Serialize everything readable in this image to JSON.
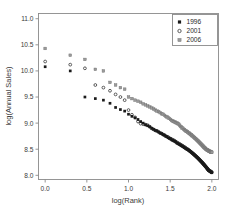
{
  "chart_data": {
    "type": "scatter",
    "title": "",
    "xlabel": "log(Rank)",
    "ylabel": "log(Annual Sales)",
    "xlim": [
      -0.08,
      2.08
    ],
    "ylim": [
      7.92,
      11.1
    ],
    "xticks": [
      "0.0",
      "0.5",
      "1.0",
      "1.5",
      "2.0"
    ],
    "xtick_values": [
      0.0,
      0.5,
      1.0,
      1.5,
      2.0
    ],
    "yticks": [
      "8.0",
      "8.5",
      "9.0",
      "9.5",
      "10.0",
      "10.5",
      "11.0"
    ],
    "ytick_values": [
      8.0,
      8.5,
      9.0,
      9.5,
      10.0,
      10.5,
      11.0
    ],
    "grid": false,
    "legend_position": "top-right",
    "series": [
      {
        "name": "1996",
        "marker": "filled-square",
        "color": "#1a1a1a",
        "points": [
          [
            0.0,
            10.08
          ],
          [
            0.301,
            10.0
          ],
          [
            0.477,
            9.5
          ],
          [
            0.602,
            9.47
          ],
          [
            0.699,
            9.44
          ],
          [
            0.778,
            9.38
          ],
          [
            0.845,
            9.3
          ],
          [
            0.903,
            9.26
          ],
          [
            0.954,
            9.23
          ],
          [
            1.0,
            9.17
          ],
          [
            1.041,
            9.13
          ],
          [
            1.079,
            9.1
          ],
          [
            1.114,
            9.07
          ],
          [
            1.146,
            9.03
          ],
          [
            1.176,
            9.0
          ],
          [
            1.204,
            8.97
          ],
          [
            1.23,
            8.95
          ],
          [
            1.255,
            8.93
          ],
          [
            1.279,
            8.9
          ],
          [
            1.301,
            8.88
          ],
          [
            1.322,
            8.86
          ],
          [
            1.342,
            8.85
          ],
          [
            1.362,
            8.83
          ],
          [
            1.38,
            8.81
          ],
          [
            1.398,
            8.8
          ],
          [
            1.415,
            8.78
          ],
          [
            1.431,
            8.77
          ],
          [
            1.447,
            8.75
          ],
          [
            1.462,
            8.74
          ],
          [
            1.477,
            8.72
          ],
          [
            1.491,
            8.71
          ],
          [
            1.505,
            8.7
          ],
          [
            1.519,
            8.68
          ],
          [
            1.531,
            8.67
          ],
          [
            1.544,
            8.66
          ],
          [
            1.556,
            8.65
          ],
          [
            1.568,
            8.64
          ],
          [
            1.58,
            8.62
          ],
          [
            1.591,
            8.61
          ],
          [
            1.602,
            8.6
          ],
          [
            1.613,
            8.59
          ],
          [
            1.623,
            8.58
          ],
          [
            1.633,
            8.57
          ],
          [
            1.643,
            8.56
          ],
          [
            1.653,
            8.55
          ],
          [
            1.663,
            8.54
          ],
          [
            1.672,
            8.53
          ],
          [
            1.681,
            8.52
          ],
          [
            1.69,
            8.51
          ],
          [
            1.699,
            8.5
          ],
          [
            1.708,
            8.5
          ],
          [
            1.716,
            8.49
          ],
          [
            1.724,
            8.48
          ],
          [
            1.732,
            8.47
          ],
          [
            1.74,
            8.46
          ],
          [
            1.748,
            8.45
          ],
          [
            1.756,
            8.44
          ],
          [
            1.763,
            8.43
          ],
          [
            1.771,
            8.42
          ],
          [
            1.778,
            8.41
          ],
          [
            1.785,
            8.4
          ],
          [
            1.792,
            8.39
          ],
          [
            1.799,
            8.38
          ],
          [
            1.806,
            8.37
          ],
          [
            1.813,
            8.36
          ],
          [
            1.819,
            8.35
          ],
          [
            1.826,
            8.34
          ],
          [
            1.833,
            8.33
          ],
          [
            1.839,
            8.32
          ],
          [
            1.845,
            8.31
          ],
          [
            1.851,
            8.3
          ],
          [
            1.857,
            8.29
          ],
          [
            1.863,
            8.28
          ],
          [
            1.869,
            8.27
          ],
          [
            1.875,
            8.26
          ],
          [
            1.881,
            8.25
          ],
          [
            1.887,
            8.24
          ],
          [
            1.892,
            8.23
          ],
          [
            1.898,
            8.22
          ],
          [
            1.903,
            8.21
          ],
          [
            1.909,
            8.2
          ],
          [
            1.914,
            8.19
          ],
          [
            1.919,
            8.18
          ],
          [
            1.924,
            8.17
          ],
          [
            1.93,
            8.16
          ],
          [
            1.935,
            8.15
          ],
          [
            1.94,
            8.14
          ],
          [
            1.945,
            8.13
          ],
          [
            1.95,
            8.12
          ],
          [
            1.954,
            8.11
          ],
          [
            1.959,
            8.1
          ],
          [
            1.964,
            8.09
          ],
          [
            1.968,
            8.09
          ],
          [
            1.973,
            8.08
          ],
          [
            1.978,
            8.08
          ],
          [
            1.982,
            8.07
          ],
          [
            1.987,
            8.07
          ],
          [
            1.991,
            8.06
          ],
          [
            1.996,
            8.06
          ],
          [
            2.0,
            8.05
          ]
        ]
      },
      {
        "name": "2001",
        "marker": "open-circle",
        "color": "#2b2b2b",
        "points": [
          [
            0.0,
            10.18
          ],
          [
            0.301,
            10.12
          ],
          [
            0.477,
            10.05
          ],
          [
            0.602,
            9.73
          ],
          [
            0.699,
            9.68
          ],
          [
            0.778,
            9.62
          ],
          [
            0.845,
            9.55
          ],
          [
            0.903,
            9.5
          ],
          [
            0.954,
            9.44
          ],
          [
            1.0,
            9.25
          ],
          [
            1.041,
            9.16
          ],
          [
            1.079,
            9.11
          ],
          [
            1.114,
            9.03
          ],
          [
            1.146,
            8.99
          ],
          [
            1.176,
            8.98
          ],
          [
            1.204,
            8.97
          ],
          [
            1.23,
            8.96
          ],
          [
            1.255,
            8.93
          ],
          [
            1.279,
            8.9
          ],
          [
            1.301,
            8.88
          ],
          [
            1.322,
            8.86
          ],
          [
            1.342,
            8.85
          ],
          [
            1.362,
            8.83
          ],
          [
            1.38,
            8.81
          ],
          [
            1.398,
            8.8
          ],
          [
            1.415,
            8.78
          ],
          [
            1.431,
            8.77
          ],
          [
            1.447,
            8.75
          ],
          [
            1.462,
            8.74
          ],
          [
            1.477,
            8.73
          ],
          [
            1.491,
            8.71
          ],
          [
            1.505,
            8.7
          ],
          [
            1.519,
            8.69
          ],
          [
            1.531,
            8.68
          ],
          [
            1.544,
            8.67
          ],
          [
            1.556,
            8.66
          ],
          [
            1.568,
            8.64
          ],
          [
            1.58,
            8.63
          ],
          [
            1.591,
            8.62
          ],
          [
            1.602,
            8.61
          ],
          [
            1.613,
            8.6
          ],
          [
            1.623,
            8.59
          ],
          [
            1.633,
            8.58
          ],
          [
            1.643,
            8.57
          ],
          [
            1.653,
            8.56
          ],
          [
            1.663,
            8.55
          ],
          [
            1.672,
            8.54
          ],
          [
            1.681,
            8.53
          ],
          [
            1.69,
            8.52
          ],
          [
            1.699,
            8.51
          ],
          [
            1.708,
            8.5
          ],
          [
            1.716,
            8.49
          ],
          [
            1.724,
            8.48
          ],
          [
            1.732,
            8.47
          ],
          [
            1.74,
            8.46
          ],
          [
            1.748,
            8.45
          ],
          [
            1.756,
            8.44
          ],
          [
            1.763,
            8.43
          ],
          [
            1.771,
            8.42
          ],
          [
            1.778,
            8.41
          ],
          [
            1.785,
            8.4
          ],
          [
            1.792,
            8.39
          ],
          [
            1.799,
            8.38
          ],
          [
            1.806,
            8.37
          ],
          [
            1.813,
            8.36
          ],
          [
            1.819,
            8.35
          ],
          [
            1.826,
            8.34
          ],
          [
            1.833,
            8.33
          ],
          [
            1.839,
            8.32
          ],
          [
            1.845,
            8.31
          ],
          [
            1.851,
            8.3
          ],
          [
            1.857,
            8.29
          ],
          [
            1.863,
            8.28
          ],
          [
            1.869,
            8.27
          ],
          [
            1.875,
            8.26
          ],
          [
            1.881,
            8.25
          ],
          [
            1.887,
            8.24
          ],
          [
            1.892,
            8.23
          ],
          [
            1.898,
            8.22
          ],
          [
            1.903,
            8.21
          ],
          [
            1.909,
            8.2
          ],
          [
            1.914,
            8.19
          ],
          [
            1.919,
            8.18
          ],
          [
            1.924,
            8.17
          ],
          [
            1.93,
            8.16
          ],
          [
            1.935,
            8.15
          ],
          [
            1.94,
            8.14
          ],
          [
            1.945,
            8.13
          ],
          [
            1.95,
            8.12
          ],
          [
            1.954,
            8.11
          ],
          [
            1.959,
            8.1
          ],
          [
            1.964,
            8.1
          ],
          [
            1.968,
            8.09
          ],
          [
            1.973,
            8.09
          ],
          [
            1.978,
            8.08
          ],
          [
            1.982,
            8.08
          ],
          [
            1.987,
            8.07
          ],
          [
            1.991,
            8.07
          ],
          [
            1.996,
            8.06
          ],
          [
            2.0,
            8.06
          ]
        ]
      },
      {
        "name": "2006",
        "marker": "gray-square",
        "color": "#9a9a9a",
        "points": [
          [
            0.0,
            10.43
          ],
          [
            0.301,
            10.3
          ],
          [
            0.477,
            10.22
          ],
          [
            0.602,
            10.03
          ],
          [
            0.699,
            10.0
          ],
          [
            0.778,
            9.78
          ],
          [
            0.845,
            9.73
          ],
          [
            0.903,
            9.68
          ],
          [
            0.954,
            9.65
          ],
          [
            1.0,
            9.5
          ],
          [
            1.041,
            9.47
          ],
          [
            1.079,
            9.44
          ],
          [
            1.114,
            9.42
          ],
          [
            1.146,
            9.4
          ],
          [
            1.176,
            9.37
          ],
          [
            1.204,
            9.35
          ],
          [
            1.23,
            9.33
          ],
          [
            1.255,
            9.31
          ],
          [
            1.279,
            9.29
          ],
          [
            1.301,
            9.27
          ],
          [
            1.322,
            9.25
          ],
          [
            1.342,
            9.23
          ],
          [
            1.362,
            9.22
          ],
          [
            1.38,
            9.2
          ],
          [
            1.398,
            9.18
          ],
          [
            1.415,
            9.17
          ],
          [
            1.431,
            9.15
          ],
          [
            1.447,
            9.13
          ],
          [
            1.462,
            9.12
          ],
          [
            1.477,
            9.1
          ],
          [
            1.491,
            9.09
          ],
          [
            1.505,
            9.07
          ],
          [
            1.519,
            9.05
          ],
          [
            1.531,
            9.04
          ],
          [
            1.544,
            9.03
          ],
          [
            1.556,
            9.02
          ],
          [
            1.568,
            9.01
          ],
          [
            1.58,
            9.0
          ],
          [
            1.591,
            8.99
          ],
          [
            1.602,
            8.98
          ],
          [
            1.613,
            8.96
          ],
          [
            1.623,
            8.94
          ],
          [
            1.633,
            8.93
          ],
          [
            1.643,
            8.91
          ],
          [
            1.653,
            8.9
          ],
          [
            1.663,
            8.88
          ],
          [
            1.672,
            8.87
          ],
          [
            1.681,
            8.86
          ],
          [
            1.69,
            8.85
          ],
          [
            1.699,
            8.84
          ],
          [
            1.708,
            8.83
          ],
          [
            1.716,
            8.82
          ],
          [
            1.724,
            8.81
          ],
          [
            1.732,
            8.8
          ],
          [
            1.74,
            8.79
          ],
          [
            1.748,
            8.78
          ],
          [
            1.756,
            8.77
          ],
          [
            1.763,
            8.76
          ],
          [
            1.771,
            8.75
          ],
          [
            1.778,
            8.74
          ],
          [
            1.785,
            8.73
          ],
          [
            1.792,
            8.72
          ],
          [
            1.799,
            8.71
          ],
          [
            1.806,
            8.7
          ],
          [
            1.813,
            8.69
          ],
          [
            1.819,
            8.68
          ],
          [
            1.826,
            8.67
          ],
          [
            1.833,
            8.66
          ],
          [
            1.839,
            8.65
          ],
          [
            1.845,
            8.64
          ],
          [
            1.851,
            8.63
          ],
          [
            1.857,
            8.62
          ],
          [
            1.863,
            8.61
          ],
          [
            1.869,
            8.6
          ],
          [
            1.875,
            8.59
          ],
          [
            1.881,
            8.58
          ],
          [
            1.887,
            8.57
          ],
          [
            1.892,
            8.56
          ],
          [
            1.898,
            8.55
          ],
          [
            1.903,
            8.54
          ],
          [
            1.909,
            8.53
          ],
          [
            1.914,
            8.53
          ],
          [
            1.919,
            8.52
          ],
          [
            1.924,
            8.51
          ],
          [
            1.93,
            8.5
          ],
          [
            1.935,
            8.5
          ],
          [
            1.94,
            8.49
          ],
          [
            1.945,
            8.49
          ],
          [
            1.95,
            8.48
          ],
          [
            1.954,
            8.48
          ],
          [
            1.959,
            8.47
          ],
          [
            1.964,
            8.47
          ],
          [
            1.968,
            8.46
          ],
          [
            1.973,
            8.46
          ],
          [
            1.978,
            8.46
          ],
          [
            1.982,
            8.45
          ],
          [
            1.987,
            8.45
          ],
          [
            1.991,
            8.45
          ],
          [
            1.996,
            8.44
          ],
          [
            2.0,
            8.44
          ]
        ]
      }
    ]
  },
  "legend": {
    "entries": [
      {
        "label": "1996",
        "marker": "filled-square"
      },
      {
        "label": "2001",
        "marker": "open-circle"
      },
      {
        "label": "2006",
        "marker": "gray-square"
      }
    ]
  }
}
